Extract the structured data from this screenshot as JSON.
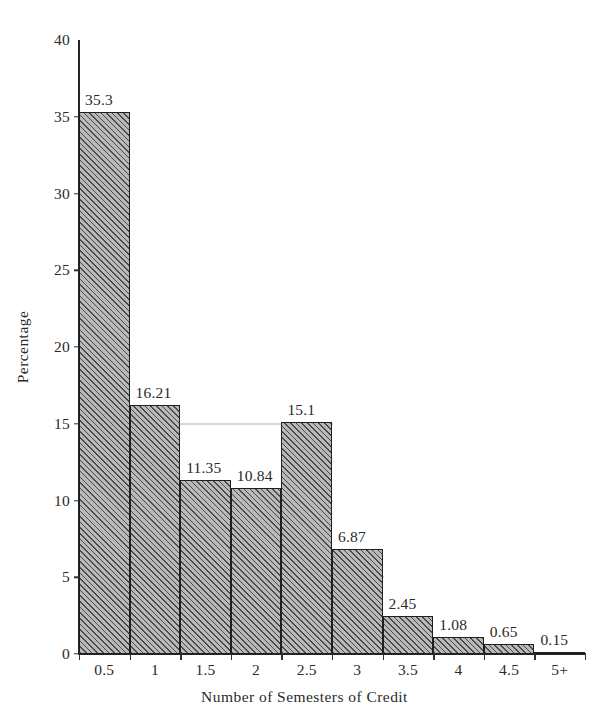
{
  "chart_data": {
    "type": "bar",
    "title": "",
    "subtitle": "",
    "xlabel": "Number of Semesters of Credit",
    "ylabel": "Percentage",
    "categories": [
      "0.5",
      "1",
      "1.5",
      "2",
      "2.5",
      "3",
      "3.5",
      "4",
      "4.5",
      "5+"
    ],
    "values": [
      35.3,
      16.21,
      11.35,
      10.84,
      15.1,
      6.87,
      2.45,
      1.08,
      0.65,
      0.15
    ],
    "value_labels": [
      "35.3",
      "16.21",
      "11.35",
      "10.84",
      "15.1",
      "6.87",
      "2.45",
      "1.08",
      "0.65",
      "0.15"
    ],
    "ylim": [
      0,
      40
    ],
    "xlim_categories": 10,
    "y_ticks": [
      0,
      5,
      10,
      15,
      20,
      25,
      30,
      35,
      40
    ],
    "y_tick_labels": [
      "0",
      "5",
      "10",
      "15",
      "20",
      "25",
      "30",
      "35",
      "40"
    ],
    "grid": "horizontal-faint",
    "legend": "none",
    "legend_position": "none",
    "bar_style": "diagonal-hatch",
    "bars_adjacent": true,
    "colors": {
      "bar_fill": "#b9b9b9",
      "bar_hatch": "#4a4a4a",
      "bar_edge": "#1f1f1f",
      "axis": "#262626",
      "text": "#2a2a2a",
      "grid": "#6a6a6a",
      "background": "#ffffff"
    }
  }
}
